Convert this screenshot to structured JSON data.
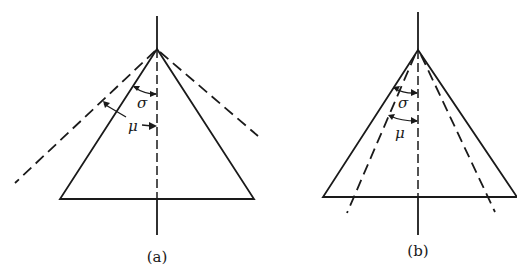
{
  "figure": {
    "panels": [
      {
        "id": "a",
        "caption": "(a)",
        "symbols": {
          "sigma": "σ",
          "mu": "μ"
        },
        "description": "Triangle (cone cross-section) with vertical dash-dot axis; dashed lines lie outside the triangle, angle μ greater than σ"
      },
      {
        "id": "b",
        "caption": "(b)",
        "symbols": {
          "sigma": "σ",
          "mu": "μ"
        },
        "description": "Triangle (cone cross-section) with vertical dash-dot axis; dashed lines lie inside the triangle, angle μ smaller than σ"
      }
    ],
    "colors": {
      "line": "#1a1a1a",
      "background": "#ffffff"
    }
  }
}
